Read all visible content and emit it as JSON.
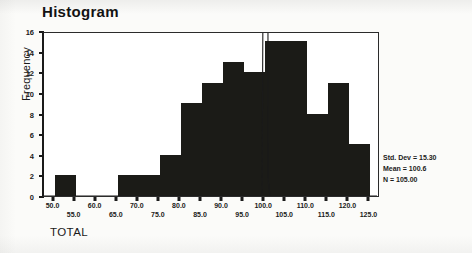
{
  "chart_data": {
    "type": "bar",
    "title": "Histogram",
    "xlabel": "TOTAL",
    "ylabel": "Frequency",
    "ylim": [
      0,
      16
    ],
    "y_ticks": [
      0,
      2,
      4,
      6,
      8,
      10,
      12,
      14,
      16
    ],
    "y_tick_labels": [
      "0",
      "2",
      "4",
      "6",
      "8",
      "10",
      "12",
      "14",
      "16"
    ],
    "xlim": [
      47.5,
      127.5
    ],
    "x_ticks": [
      50.0,
      55.0,
      60.0,
      65.0,
      70.0,
      75.0,
      80.0,
      85.0,
      90.0,
      95.0,
      100.0,
      105.0,
      110.0,
      115.0,
      120.0,
      125.0
    ],
    "x_tick_labels": [
      "50.0",
      "55.0",
      "60.0",
      "65.0",
      "70.0",
      "75.0",
      "80.0",
      "85.0",
      "90.0",
      "95.0",
      "100.0",
      "105.0",
      "110.0",
      "115.0",
      "120.0",
      "125.0"
    ],
    "bin_width": 5,
    "categories": [
      "50.0",
      "55.0",
      "60.0",
      "65.0",
      "70.0",
      "75.0",
      "80.0",
      "85.0",
      "90.0",
      "95.0",
      "100.0",
      "105.0",
      "110.0",
      "115.0",
      "120.0"
    ],
    "values": [
      2,
      0,
      0,
      2,
      2,
      4,
      9,
      11,
      13,
      12,
      15,
      15,
      8,
      11,
      5
    ],
    "grid": false,
    "legend": "none",
    "overlay_curve": "normal",
    "bar_color": "#1b1b17",
    "annotations": [
      "Std. Dev = 15.30",
      "Mean = 100.6",
      "N = 105.00"
    ]
  },
  "stats": {
    "std_dev": "Std. Dev = 15.30",
    "mean": "Mean = 100.6",
    "n": "N = 105.00"
  }
}
